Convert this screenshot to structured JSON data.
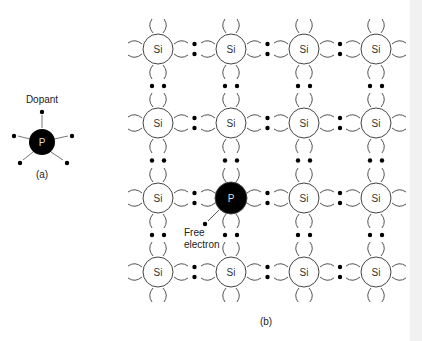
{
  "figure": {
    "panel_a": {
      "caption": "(a)",
      "label": "Dopant",
      "atom_symbol": "P",
      "valence_electrons": 5
    },
    "panel_b": {
      "caption": "(b)",
      "host_atom_symbol": "Si",
      "dopant_atom_symbol": "P",
      "grid_rows": 4,
      "grid_cols": 4,
      "dopant_position": {
        "row": 3,
        "col": 2
      },
      "free_electron_label_line1": "Free",
      "free_electron_label_line2": "electron"
    }
  },
  "colors": {
    "atom_fill_host": "#ffffff",
    "atom_fill_dopant": "#000000",
    "electron": "#000000",
    "bond_stroke": "#555555"
  }
}
